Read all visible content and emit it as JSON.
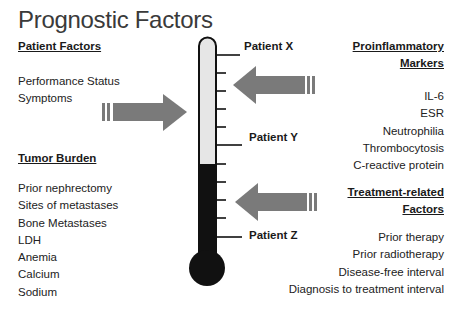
{
  "title": "Prognostic Factors",
  "left": {
    "patient_factors": {
      "heading": "Patient Factors",
      "items": [
        "Performance Status",
        "Symptoms"
      ]
    },
    "tumor_burden": {
      "heading": "Tumor Burden",
      "items": [
        "Prior nephrectomy",
        "Sites of metastases",
        "Bone Metastases",
        "LDH",
        "Anemia",
        "Calcium",
        "Sodium"
      ]
    }
  },
  "right": {
    "proinflammatory": {
      "heading_line1": "Proinflammatory",
      "heading_line2": "Markers",
      "items": [
        "IL-6",
        "ESR",
        "Neutrophilia",
        "Thrombocytosis",
        "C-reactive protein"
      ]
    },
    "treatment": {
      "heading_line1": "Treatment-related",
      "heading_line2": "Factors",
      "items": [
        "Prior therapy",
        "Prior radiotherapy",
        "Disease-free interval",
        "Diagnosis to treatment interval"
      ]
    }
  },
  "thermometer": {
    "labels": [
      "Patient X",
      "Patient Y",
      "Patient Z"
    ],
    "fill_color": "#111111",
    "empty_color": "#e6e6e6",
    "arrow_color": "#7a7a7a"
  }
}
